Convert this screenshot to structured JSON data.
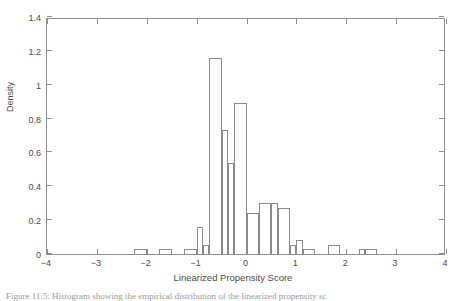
{
  "chart_data": {
    "type": "bar",
    "title": "",
    "subtitle": "",
    "xlabel": "Linearized Propensity Score",
    "ylabel": "Density",
    "xlim": [
      -4,
      4
    ],
    "ylim": [
      0,
      1.4
    ],
    "grid": false,
    "legend": null,
    "bin_width": 0.25,
    "xticks": [
      "-4",
      "-3",
      "-2",
      "-1",
      "0",
      "1",
      "2",
      "3",
      "4"
    ],
    "xtick_values": [
      -4,
      -3,
      -2,
      -1,
      0,
      1,
      2,
      3,
      4
    ],
    "yticks": [
      "0",
      "0.2",
      "0.4",
      "0.6",
      "0.8",
      "1",
      "1.2",
      "1.4"
    ],
    "ytick_values": [
      0,
      0.2,
      0.4,
      0.6,
      0.8,
      1,
      1.2,
      1.4
    ],
    "bin_edges": [
      -2.25,
      -2.0,
      -1.75,
      -1.5,
      -1.25,
      -1.0,
      -0.75,
      -0.5,
      -0.25,
      0.0,
      0.25,
      0.5,
      0.75,
      1.0,
      1.25,
      1.5,
      1.75,
      2.0,
      2.25,
      2.5
    ],
    "bars": [
      {
        "x_left": -2.25,
        "x_right": -2.0,
        "density": 0.03
      },
      {
        "x_left": -1.75,
        "x_right": -1.5,
        "density": 0.03
      },
      {
        "x_left": -1.25,
        "x_right": -1.0,
        "density": 0.03
      },
      {
        "x_left": -1.0,
        "x_right": -0.875,
        "density": 0.16
      },
      {
        "x_left": -0.875,
        "x_right": -0.75,
        "density": 0.055
      },
      {
        "x_left": -0.75,
        "x_right": -0.5,
        "density": 1.16
      },
      {
        "x_left": -0.5,
        "x_right": -0.375,
        "density": 0.735
      },
      {
        "x_left": -0.375,
        "x_right": -0.25,
        "density": 0.54
      },
      {
        "x_left": -0.25,
        "x_right": 0.0,
        "density": 0.895
      },
      {
        "x_left": 0.0,
        "x_right": 0.25,
        "density": 0.24
      },
      {
        "x_left": 0.25,
        "x_right": 0.5,
        "density": 0.3
      },
      {
        "x_left": 0.5,
        "x_right": 0.625,
        "density": 0.3
      },
      {
        "x_left": 0.625,
        "x_right": 0.875,
        "density": 0.27
      },
      {
        "x_left": 0.875,
        "x_right": 1.0,
        "density": 0.055
      },
      {
        "x_left": 1.0,
        "x_right": 1.125,
        "density": 0.08
      },
      {
        "x_left": 1.125,
        "x_right": 1.375,
        "density": 0.03
      },
      {
        "x_left": 1.625,
        "x_right": 1.875,
        "density": 0.055
      },
      {
        "x_left": 2.25,
        "x_right": 2.375,
        "density": 0.03
      },
      {
        "x_left": 2.375,
        "x_right": 2.625,
        "density": 0.03
      }
    ]
  },
  "figure": {
    "caption_partial": "Figure 11.5:  Histogram showing the empirical distribution of the linearized propensity sc"
  },
  "colors": {
    "axis": "#8e8e8e",
    "bar_edge": "#8a8a8a",
    "text": "#4a4a4a",
    "background": "#ffffff"
  }
}
